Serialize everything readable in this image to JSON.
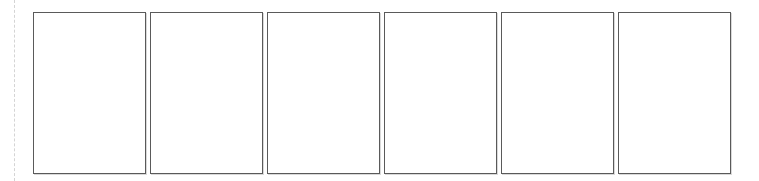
{
  "page_strip": {
    "pages": [
      {
        "index": 1,
        "content": ""
      },
      {
        "index": 2,
        "content": ""
      },
      {
        "index": 3,
        "content": ""
      },
      {
        "index": 4,
        "content": ""
      },
      {
        "index": 5,
        "content": ""
      },
      {
        "index": 6,
        "content": ""
      }
    ]
  },
  "colors": {
    "background": "#ffffff",
    "page_border": "#5a5a5a",
    "guide_line": "#d4d4d4"
  }
}
